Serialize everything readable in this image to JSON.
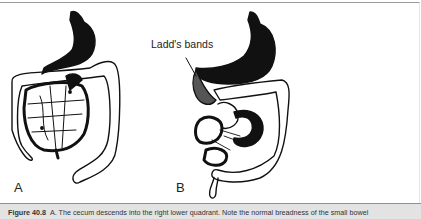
{
  "figure": {
    "panels": [
      {
        "label": "A"
      },
      {
        "label": "B"
      }
    ],
    "callouts": [
      {
        "text": "Ladd's bands"
      }
    ]
  },
  "caption": {
    "figure_number": "Figure 40.8",
    "text": "A. The cecum descends into the right lower quadrant. Note the normal breadness of the small bowel"
  },
  "colors": {
    "ink": "#111111",
    "caption_bg": "#e3e3e3",
    "rule": "#9a9a9a"
  }
}
